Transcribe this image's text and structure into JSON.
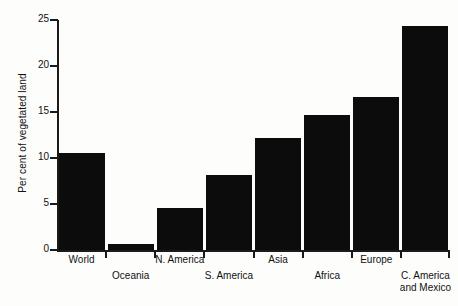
{
  "chart_data": {
    "type": "bar",
    "title": "",
    "xlabel": "",
    "ylabel": "Per cent of vegetated land",
    "ylim": [
      0,
      25
    ],
    "yticks": [
      0,
      5,
      10,
      15,
      20,
      25
    ],
    "ytick_labels": [
      "0",
      "5",
      "10",
      "15",
      "20",
      "25"
    ],
    "grid": false,
    "legend": false,
    "bar_color": "#0c0c0c",
    "categories": [
      "World",
      "Oceania",
      "N. America",
      "S. America",
      "Asia",
      "Africa",
      "Europe",
      "C. America\nand Mexico"
    ],
    "values": [
      10.5,
      0.6,
      4.6,
      8.2,
      12.2,
      14.7,
      16.6,
      24.4
    ],
    "label_rows": [
      "top",
      "bottom",
      "top",
      "bottom",
      "top",
      "bottom",
      "top",
      "bottom"
    ]
  }
}
